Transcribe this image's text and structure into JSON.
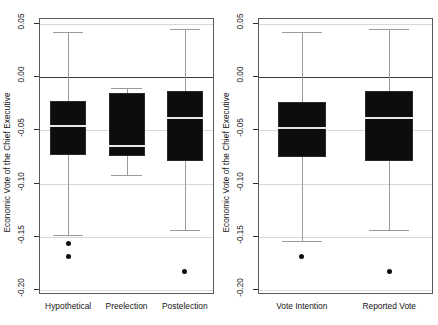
{
  "chart_data": {
    "type": "box",
    "title": "",
    "ylabel": "Economic Vote of the Chief Executive",
    "xlabel": "",
    "ylim": [
      -0.205,
      0.055
    ],
    "yticks": [
      0.05,
      0.0,
      -0.05,
      -0.1,
      -0.15,
      -0.2
    ],
    "ytick_labels": [
      "0.05",
      "0.00",
      "-0.05",
      "-0.10",
      "-0.15",
      "-0.20"
    ],
    "grid": true,
    "legend": "none",
    "panels": [
      {
        "name": "panel-left",
        "ylabel": "Economic Vote of the Chief Executive",
        "categories": [
          "Hypothetical",
          "Preelection",
          "Postelection"
        ],
        "boxes": [
          {
            "label": "Hypothetical",
            "whisker_high": 0.042,
            "q3": -0.023,
            "median": -0.047,
            "q1": -0.074,
            "whisker_low": -0.149,
            "outliers": [
              -0.157,
              -0.17
            ]
          },
          {
            "label": "Preelection",
            "whisker_high": -0.011,
            "q3": -0.016,
            "median": -0.066,
            "q1": -0.075,
            "whisker_low": -0.093,
            "outliers": []
          },
          {
            "label": "Postelection",
            "whisker_high": 0.045,
            "q3": -0.014,
            "median": -0.039,
            "q1": -0.08,
            "whisker_low": -0.145,
            "outliers": [
              -0.184
            ]
          }
        ]
      },
      {
        "name": "panel-right",
        "ylabel": "Economic Vote of the Chief Executive",
        "categories": [
          "Vote Intention",
          "Reported Vote"
        ],
        "boxes": [
          {
            "label": "Vote Intention",
            "whisker_high": 0.042,
            "q3": -0.024,
            "median": -0.049,
            "q1": -0.076,
            "whisker_low": -0.155,
            "outliers": [
              -0.17
            ]
          },
          {
            "label": "Reported Vote",
            "whisker_high": 0.045,
            "q3": -0.014,
            "median": -0.039,
            "q1": -0.08,
            "whisker_low": -0.145,
            "outliers": [
              -0.184
            ]
          }
        ]
      }
    ]
  },
  "style": {
    "box_fill": "#0d0d0d",
    "median_color": "#e8e8e8",
    "whisker_color": "#9a9a9a",
    "grid_color": "#d8d8d8",
    "zero_line_color": "#3b3b3b",
    "frame_color": "#5a5a5a",
    "background": "#ffffff"
  }
}
